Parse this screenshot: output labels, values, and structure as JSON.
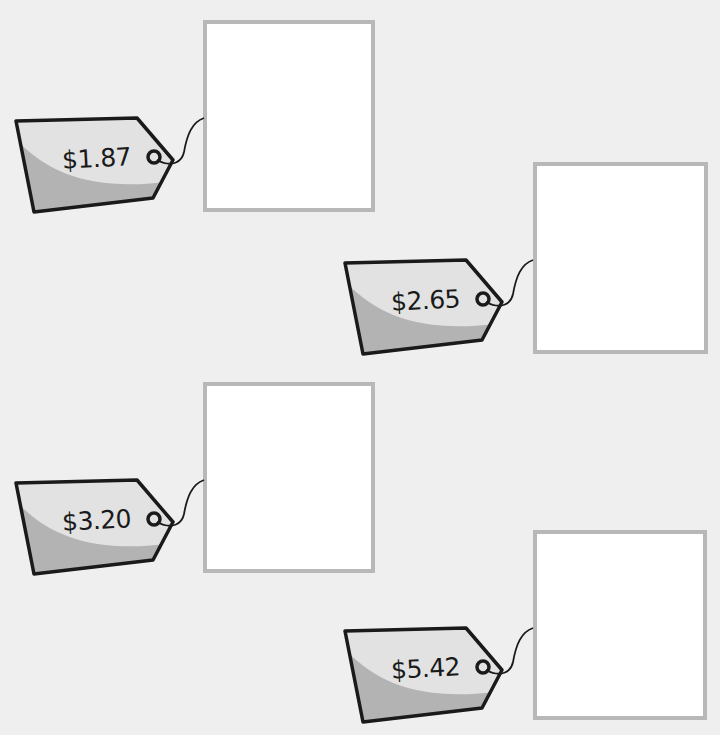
{
  "worksheet": {
    "colors": {
      "background": "#efefef",
      "tag_light": "#e2e2e2",
      "tag_dark": "#b3b3b3",
      "tag_outline": "#1a1a1a",
      "box_border": "#b8b8b8"
    },
    "items": [
      {
        "price": "$1.87",
        "answer": ""
      },
      {
        "price": "$2.65",
        "answer": ""
      },
      {
        "price": "$3.20",
        "answer": ""
      },
      {
        "price": "$5.42",
        "answer": ""
      }
    ]
  }
}
